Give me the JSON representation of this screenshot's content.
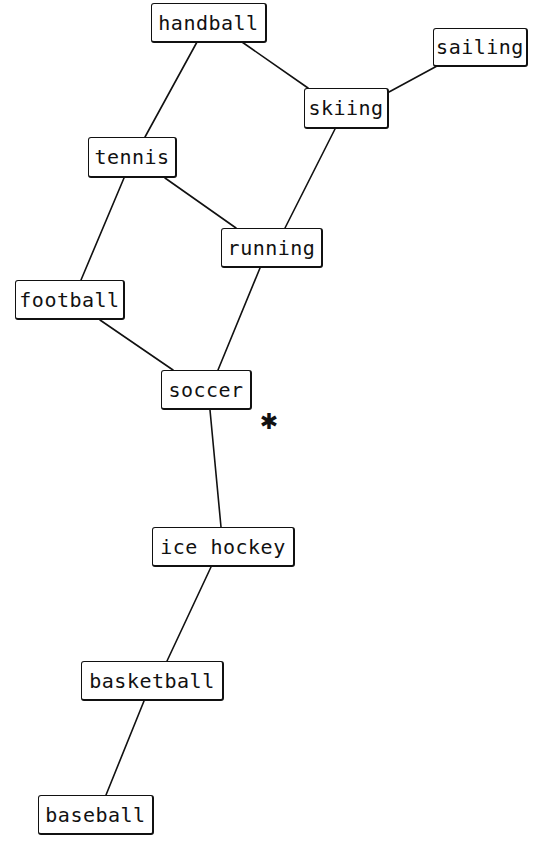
{
  "diagram": {
    "type": "graph",
    "nodes": [
      {
        "id": "handball",
        "label": "handball",
        "box": {
          "x": 151,
          "y": 3,
          "w": 116,
          "h": 40
        }
      },
      {
        "id": "sailing",
        "label": "sailing",
        "box": {
          "x": 433,
          "y": 28,
          "w": 95,
          "h": 39
        }
      },
      {
        "id": "skiing",
        "label": "skiing",
        "box": {
          "x": 304,
          "y": 88,
          "w": 85,
          "h": 41
        }
      },
      {
        "id": "tennis",
        "label": "tennis",
        "box": {
          "x": 88,
          "y": 137,
          "w": 89,
          "h": 41
        }
      },
      {
        "id": "running",
        "label": "running",
        "box": {
          "x": 221,
          "y": 228,
          "w": 102,
          "h": 40
        }
      },
      {
        "id": "football",
        "label": "football",
        "box": {
          "x": 15,
          "y": 280,
          "w": 110,
          "h": 40
        }
      },
      {
        "id": "soccer",
        "label": "soccer",
        "box": {
          "x": 161,
          "y": 370,
          "w": 91,
          "h": 40
        }
      },
      {
        "id": "ice_hockey",
        "label": "ice hockey",
        "box": {
          "x": 152,
          "y": 527,
          "w": 143,
          "h": 40
        }
      },
      {
        "id": "basketball",
        "label": "basketball",
        "box": {
          "x": 81,
          "y": 661,
          "w": 143,
          "h": 40
        }
      },
      {
        "id": "baseball",
        "label": "baseball",
        "box": {
          "x": 38,
          "y": 795,
          "w": 116,
          "h": 40
        }
      }
    ],
    "edges": [
      {
        "from": "handball",
        "to": "tennis",
        "x1": 197,
        "y1": 42,
        "x2": 145,
        "y2": 137
      },
      {
        "from": "handball",
        "to": "skiing",
        "x1": 242,
        "y1": 42,
        "x2": 308,
        "y2": 88
      },
      {
        "from": "sailing",
        "to": "skiing",
        "x1": 437,
        "y1": 66,
        "x2": 389,
        "y2": 92
      },
      {
        "from": "skiing",
        "to": "running",
        "x1": 335,
        "y1": 129,
        "x2": 285,
        "y2": 228
      },
      {
        "from": "tennis",
        "to": "running",
        "x1": 165,
        "y1": 178,
        "x2": 236,
        "y2": 228
      },
      {
        "from": "tennis",
        "to": "football",
        "x1": 124,
        "y1": 178,
        "x2": 81,
        "y2": 280
      },
      {
        "from": "running",
        "to": "soccer",
        "x1": 260,
        "y1": 268,
        "x2": 218,
        "y2": 370
      },
      {
        "from": "football",
        "to": "soccer",
        "x1": 100,
        "y1": 320,
        "x2": 173,
        "y2": 370
      },
      {
        "from": "soccer",
        "to": "ice_hockey",
        "x1": 210,
        "y1": 410,
        "x2": 221,
        "y2": 527
      },
      {
        "from": "ice_hockey",
        "to": "basketball",
        "x1": 211,
        "y1": 567,
        "x2": 167,
        "y2": 661
      },
      {
        "from": "basketball",
        "to": "baseball",
        "x1": 144,
        "y1": 701,
        "x2": 106,
        "y2": 795
      }
    ],
    "marker": {
      "symbol": "✱",
      "name": "asterisk-cursor",
      "x": 269,
      "y": 422
    },
    "colors": {
      "stroke": "#111111",
      "background": "#ffffff",
      "text": "#111111"
    }
  }
}
